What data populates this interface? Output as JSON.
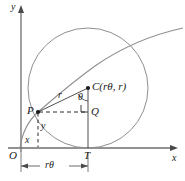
{
  "figure": {
    "kind": "geometry-diagram",
    "colors": {
      "axis": "#6e6e6e",
      "circle": "#8c8c8c",
      "cycloid": "#8c8c8c",
      "construction": "#4a4a4a",
      "dashed": "#2b2b2b",
      "label": "#1a1a1a",
      "background": "#ffffff"
    },
    "axes": {
      "x_label": "x",
      "y_label": "y",
      "origin_label": "O"
    },
    "points": [
      {
        "id": "P",
        "label": "P",
        "x": 38,
        "y": 112
      },
      {
        "id": "C",
        "label": "C(rθ, r)",
        "x": 88,
        "y": 88
      },
      {
        "id": "Q",
        "label": "Q",
        "x": 88,
        "y": 112
      },
      {
        "id": "T",
        "label": "T",
        "x": 88,
        "y": 148
      },
      {
        "id": "O",
        "label": "O",
        "x": 21,
        "y": 148
      }
    ],
    "segment_labels": {
      "radius": "r",
      "angle": "θ",
      "vertical_leg": "y",
      "horizontal_leg": "x",
      "arc_length": "rθ"
    },
    "geometry": {
      "circle_center_x": 88,
      "circle_center_y": 88,
      "circle_radius": 60,
      "x_axis_y": 148,
      "y_axis_x": 21,
      "right_angle_marker_at": "Q"
    }
  }
}
